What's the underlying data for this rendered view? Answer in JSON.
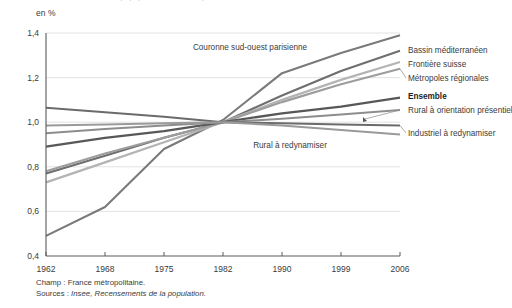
{
  "figure": {
    "unit_label": "en %",
    "footnote_champ": "Champ : France métropolitaine.",
    "footnote_sources_lead": "Sources : ",
    "footnote_sources": "Insee, Recensements de la population."
  },
  "chart_data": {
    "type": "line",
    "title": "",
    "xlabel": "",
    "ylabel": "en %",
    "x": [
      1962,
      1968,
      1975,
      1982,
      1990,
      1999,
      2006
    ],
    "xticklabels": [
      "1962",
      "1968",
      "1975",
      "1982",
      "1990",
      "1999",
      "2006"
    ],
    "yticks": [
      0.4,
      0.6,
      0.8,
      1.0,
      1.2,
      1.4
    ],
    "yticklabels": [
      "0,4",
      "0,6",
      "0,8",
      "1,0",
      "1,2",
      "1,4"
    ],
    "ylim": [
      0.4,
      1.4
    ],
    "grid": "horizontal",
    "legend_position": "right-of-axes-inline",
    "series": [
      {
        "name": "Couronne sud-ouest parisienne",
        "color": "#7a7a7a",
        "width": 2.1,
        "label_position": "inside-top",
        "values": [
          0.49,
          0.62,
          0.88,
          1.01,
          1.22,
          1.31,
          1.39
        ]
      },
      {
        "name": "Bassin méditerranéen",
        "color": "#6e6e6e",
        "width": 2.1,
        "label_position": "right",
        "values": [
          0.77,
          0.85,
          0.93,
          1.0,
          1.12,
          1.23,
          1.32
        ]
      },
      {
        "name": "Frontière suisse",
        "color": "#b4b4b4",
        "width": 2.3,
        "label_position": "right",
        "values": [
          0.73,
          0.82,
          0.91,
          1.0,
          1.1,
          1.19,
          1.27
        ]
      },
      {
        "name": "Métropoles régionales",
        "color": "#9d9d9d",
        "width": 2.1,
        "label_position": "right",
        "values": [
          0.78,
          0.86,
          0.93,
          1.0,
          1.09,
          1.17,
          1.24
        ]
      },
      {
        "name": "Ensemble",
        "color": "#585858",
        "width": 2.3,
        "label_position": "right",
        "values": [
          0.89,
          0.93,
          0.96,
          1.0,
          1.04,
          1.07,
          1.11
        ]
      },
      {
        "name": "Rural à orientation présentielle",
        "color": "#8d8d8d",
        "width": 2.0,
        "label_position": "right",
        "values": [
          0.95,
          0.97,
          0.985,
          1.0,
          1.015,
          1.035,
          1.055
        ]
      },
      {
        "name": "Industriel à redynamiser",
        "color": "#6b6b6b",
        "width": 2.0,
        "label_position": "right",
        "values": [
          1.065,
          1.045,
          1.025,
          1.0,
          0.995,
          0.99,
          0.985
        ]
      },
      {
        "name": "Rural à redynamiser",
        "color": "#9a9a9a",
        "width": 2.0,
        "label_position": "inside-bottom",
        "values": [
          0.985,
          0.99,
          0.995,
          1.0,
          0.985,
          0.965,
          0.945
        ]
      }
    ]
  }
}
